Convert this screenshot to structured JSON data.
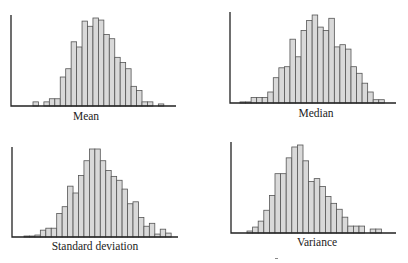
{
  "chart_data": [
    {
      "type": "bar",
      "title": "",
      "xlabel": "Mean",
      "ylabel": "",
      "grid": false,
      "bar_fill": "#d9d9d9",
      "bar_stroke": "#555555",
      "values": [
        4,
        0,
        4,
        7,
        7,
        28,
        36,
        62,
        57,
        82,
        77,
        85,
        83,
        69,
        65,
        47,
        42,
        36,
        19,
        15,
        4,
        4,
        0,
        2
      ]
    },
    {
      "type": "bar",
      "title": "",
      "xlabel": "Median",
      "ylabel": "",
      "grid": false,
      "bar_fill": "#d9d9d9",
      "bar_stroke": "#555555",
      "values": [
        1,
        1,
        5,
        5,
        5,
        10,
        23,
        32,
        33,
        58,
        42,
        66,
        75,
        80,
        69,
        66,
        77,
        51,
        53,
        49,
        33,
        27,
        18,
        10,
        3,
        3
      ]
    },
    {
      "type": "bar",
      "title": "",
      "xlabel": "Standard deviation",
      "ylabel": "",
      "grid": false,
      "bar_fill": "#d9d9d9",
      "bar_stroke": "#555555",
      "values": [
        1,
        1,
        2,
        7,
        9,
        9,
        24,
        31,
        52,
        45,
        63,
        78,
        90,
        90,
        78,
        68,
        62,
        58,
        49,
        34,
        36,
        20,
        11,
        14,
        3,
        8,
        4
      ]
    },
    {
      "type": "bar",
      "title": "",
      "xlabel": "Variance",
      "ylabel": "",
      "grid": false,
      "bar_fill": "#d9d9d9",
      "bar_stroke": "#555555",
      "values": [
        2,
        6,
        12,
        23,
        38,
        60,
        60,
        76,
        87,
        89,
        73,
        52,
        55,
        47,
        37,
        30,
        24,
        16,
        7,
        7,
        7,
        0,
        4,
        4
      ]
    }
  ]
}
